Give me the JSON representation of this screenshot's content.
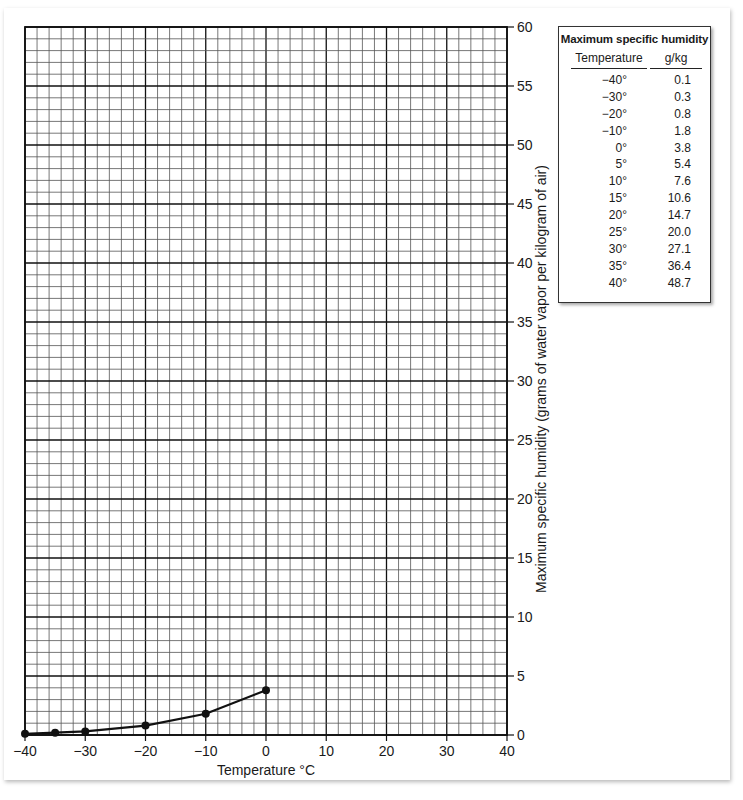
{
  "chart_data": {
    "type": "line",
    "title": "",
    "xlabel": "Temperature °C",
    "ylabel": "Maximum specific humidity (grams of water vapor per kilogram of air)",
    "xlim": [
      -40,
      40
    ],
    "ylim": [
      0,
      60
    ],
    "x_ticks": [
      "−40",
      "−30",
      "−20",
      "−10",
      "0",
      "10",
      "20",
      "30",
      "40"
    ],
    "y_ticks": [
      "0",
      "5",
      "10",
      "15",
      "20",
      "25",
      "30",
      "35",
      "40",
      "45",
      "50",
      "55",
      "60"
    ],
    "y_axis_position": "right",
    "grid": {
      "on": true,
      "x_minor_step": 2,
      "x_major_step": 10,
      "y_minor_step": 1,
      "y_major_step": 5
    },
    "series": [
      {
        "name": "Plotted maximum specific humidity",
        "x": [
          -40,
          -35,
          -30,
          -20,
          -10,
          0
        ],
        "values": [
          0.1,
          0.2,
          0.3,
          0.8,
          1.8,
          3.8
        ]
      }
    ]
  },
  "table": {
    "title": "Maximum specific humidity",
    "columns": [
      "Temperature",
      "g/kg"
    ],
    "rows": [
      {
        "temp": "−40°",
        "value": "0.1"
      },
      {
        "temp": "−30°",
        "value": "0.3"
      },
      {
        "temp": "−20°",
        "value": "0.8"
      },
      {
        "temp": "−10°",
        "value": "1.8"
      },
      {
        "temp": "0°",
        "value": "3.8"
      },
      {
        "temp": "5°",
        "value": "5.4"
      },
      {
        "temp": "10°",
        "value": "7.6"
      },
      {
        "temp": "15°",
        "value": "10.6"
      },
      {
        "temp": "20°",
        "value": "14.7"
      },
      {
        "temp": "25°",
        "value": "20.0"
      },
      {
        "temp": "30°",
        "value": "27.1"
      },
      {
        "temp": "35°",
        "value": "36.4"
      },
      {
        "temp": "40°",
        "value": "48.7"
      }
    ]
  },
  "colors": {
    "grid_minor": "#555555",
    "grid_major": "#111111",
    "line": "#111111",
    "background": "#ffffff"
  }
}
